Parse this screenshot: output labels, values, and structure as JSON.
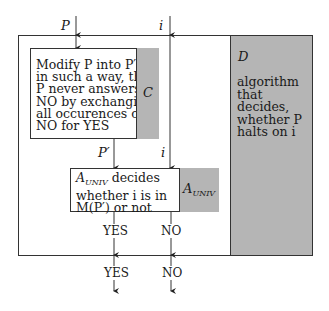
{
  "inputs": {
    "p_label": "P",
    "i_label": "i"
  },
  "box_c": {
    "lines": [
      "Modify P into P′",
      "in such a way, that",
      "P never answers",
      "NO by exchanging",
      "all occurences of",
      "NO for YES"
    ],
    "tag": "C"
  },
  "box_d": {
    "tag": "D",
    "lines": [
      "algorithm",
      "that decides,",
      "whether P",
      "halts on i"
    ]
  },
  "mid_labels": {
    "p_prime": "P′",
    "i": "i"
  },
  "box_a": {
    "line1_main": "A",
    "line1_sub": "UNIV",
    "line1_rest": " decides",
    "line2": "whether i is in",
    "line3": "M(P′) or not",
    "tag_main": "A",
    "tag_sub": "UNIV"
  },
  "outputs": {
    "inner_yes": "YES",
    "inner_no": "NO",
    "outer_yes": "YES",
    "outer_no": "NO"
  },
  "colors": {
    "grey_fill": "#b5b5b5",
    "line": "#333333"
  }
}
